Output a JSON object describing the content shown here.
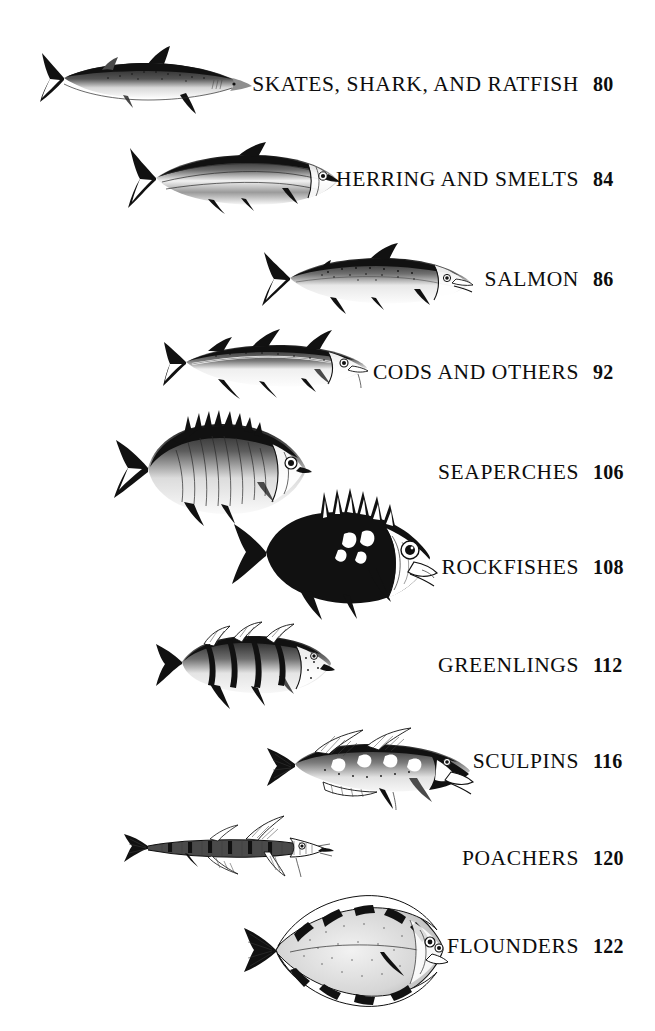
{
  "page": {
    "kind": "table-of-contents",
    "background_color": "#ffffff",
    "text_color": "#111111"
  },
  "entries": [
    {
      "label": "SKATES, SHARK, AND RATFISH",
      "page_number": "80",
      "illustration": "shark-illustration",
      "text_baseline_y": 90,
      "figure": {
        "x": 36,
        "y": 44,
        "w": 218,
        "h": 72
      }
    },
    {
      "label": "HERRING AND SMELTS",
      "page_number": "84",
      "illustration": "herring-illustration",
      "text_baseline_y": 185,
      "figure": {
        "x": 122,
        "y": 142,
        "w": 220,
        "h": 72
      }
    },
    {
      "label": "SALMON",
      "page_number": "86",
      "illustration": "salmon-illustration",
      "text_baseline_y": 285,
      "figure": {
        "x": 258,
        "y": 242,
        "w": 216,
        "h": 74
      }
    },
    {
      "label": "CODS AND OTHERS",
      "page_number": "92",
      "illustration": "cod-illustration",
      "text_baseline_y": 378,
      "figure": {
        "x": 156,
        "y": 322,
        "w": 214,
        "h": 78
      }
    },
    {
      "label": "SEAPERCHES",
      "page_number": "106",
      "illustration": "seaperch-illustration",
      "text_baseline_y": 478,
      "figure": {
        "x": 104,
        "y": 410,
        "w": 212,
        "h": 116
      }
    },
    {
      "label": "ROCKFISHES",
      "page_number": "108",
      "illustration": "rockfish-illustration",
      "text_baseline_y": 573,
      "figure": {
        "x": 226,
        "y": 486,
        "w": 214,
        "h": 134
      }
    },
    {
      "label": "GREENLINGS",
      "page_number": "112",
      "illustration": "greenling-illustration",
      "text_baseline_y": 671,
      "figure": {
        "x": 148,
        "y": 616,
        "w": 188,
        "h": 94
      }
    },
    {
      "label": "SCULPINS",
      "page_number": "116",
      "illustration": "sculpin-illustration",
      "text_baseline_y": 767,
      "figure": {
        "x": 261,
        "y": 724,
        "w": 214,
        "h": 86
      }
    },
    {
      "label": "POACHERS",
      "page_number": "120",
      "illustration": "poacher-illustration",
      "text_baseline_y": 864,
      "figure": {
        "x": 118,
        "y": 808,
        "w": 216,
        "h": 72
      }
    },
    {
      "label": "FLOUNDERS",
      "page_number": "122",
      "illustration": "flounder-illustration",
      "text_baseline_y": 952,
      "figure": {
        "x": 234,
        "y": 880,
        "w": 216,
        "h": 140
      }
    }
  ]
}
